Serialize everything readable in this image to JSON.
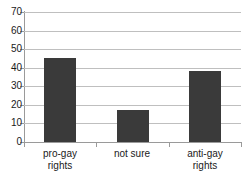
{
  "chart_data": {
    "type": "bar",
    "title": "",
    "subtitle": "",
    "xlabel": "",
    "ylabel": "",
    "categories": [
      "pro-gay rights",
      "not sure",
      "anti-gay rights"
    ],
    "category_lines": [
      [
        "pro-gay",
        "rights"
      ],
      [
        "not sure"
      ],
      [
        "anti-gay",
        "rights"
      ]
    ],
    "values": [
      45,
      17,
      38
    ],
    "ylim": [
      0,
      70
    ],
    "ytick_step": 10,
    "yticks": [
      0,
      10,
      20,
      30,
      40,
      50,
      60,
      70
    ],
    "ytick_labels": [
      "0",
      "10",
      "20",
      "30",
      "40",
      "50",
      "60",
      "70"
    ],
    "grid": true,
    "grid_axis": "y",
    "legend": false,
    "legend_position": "none",
    "colors": {
      "bar": "#3a3a3a",
      "gridline": "#bfbfbf",
      "axis": "#9a9a9a",
      "text": "#1a1a1a",
      "background": "#ffffff"
    }
  }
}
